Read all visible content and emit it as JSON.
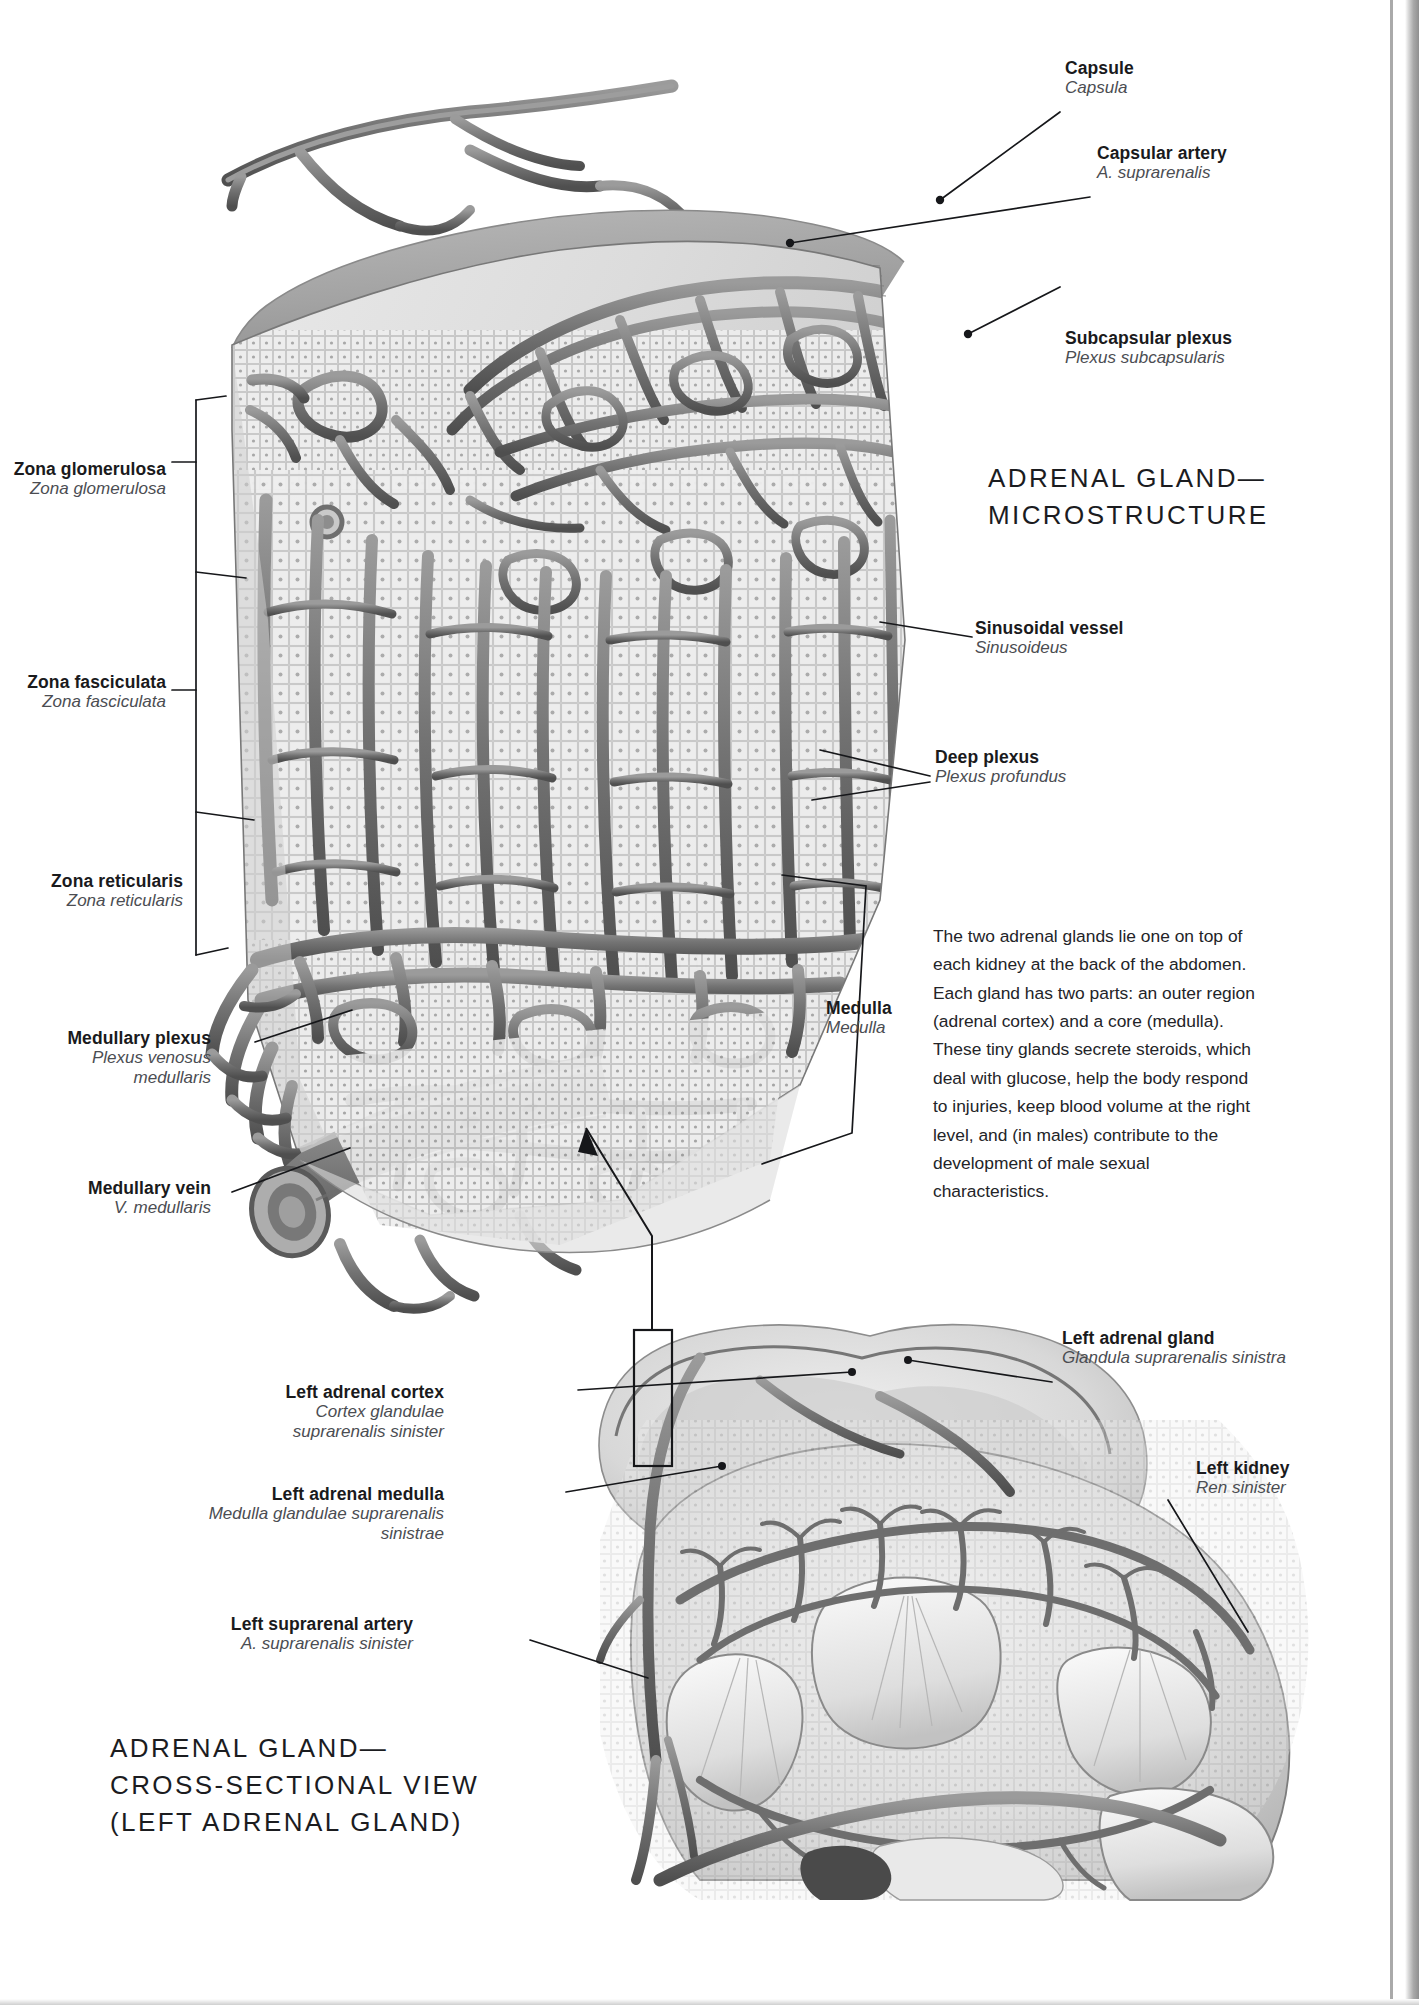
{
  "page": {
    "background": "#ffffff",
    "ink": "#1a1a1c",
    "latin_ink": "#4b4d52"
  },
  "titles": {
    "top": {
      "line1": "ADRENAL GLAND—",
      "line2": "MICROSTRUCTURE"
    },
    "bottom": {
      "line1": "ADRENAL GLAND—",
      "line2": "CROSS-SECTIONAL VIEW",
      "line3": "(LEFT ADRENAL GLAND)"
    }
  },
  "body_text": "The two adrenal glands lie one on top of each kidney at the back of the abdomen. Each gland has two parts: an outer region (adrenal cortex) and a core (medulla). These tiny glands secrete steroids, which deal with glucose, help the body respond to injuries, keep blood volume at the right level, and (in males) contribute to the development of male sexual characteristics.",
  "labels_top_right": [
    {
      "en": "Capsule",
      "la": "Capsula"
    },
    {
      "en": "Capsular artery",
      "la": "A. suprarenalis"
    },
    {
      "en": "Subcapsular plexus",
      "la": "Plexus subcapsularis"
    },
    {
      "en": "Sinusoidal vessel",
      "la": "Sinusoideus"
    },
    {
      "en": "Deep plexus",
      "la": "Plexus profundus"
    },
    {
      "en": "Medulla",
      "la": "Medulla"
    }
  ],
  "labels_top_left": [
    {
      "en": "Zona glomerulosa",
      "la": "Zona glomerulosa"
    },
    {
      "en": "Zona fasciculata",
      "la": "Zona fasciculata"
    },
    {
      "en": "Zona reticularis",
      "la": "Zona reticularis"
    },
    {
      "en": "Medullary plexus",
      "la": "Plexus venosus",
      "la2": "medullaris"
    },
    {
      "en": "Medullary vein",
      "la": "V. medullaris"
    }
  ],
  "labels_bottom_left": [
    {
      "en": "Left adrenal cortex",
      "la": "Cortex glandulae",
      "la2": "suprarenalis sinister"
    },
    {
      "en": "Left adrenal medulla",
      "la": "Medulla glandulae suprarenalis",
      "la2": "sinistrae"
    },
    {
      "en": "Left suprarenal artery",
      "la": "A. suprarenalis sinister"
    }
  ],
  "labels_bottom_right": [
    {
      "en": "Left adrenal gland",
      "la": "Glandula suprarenalis sinistra"
    },
    {
      "en": "Left kidney",
      "la": "Ren sinister"
    }
  ]
}
